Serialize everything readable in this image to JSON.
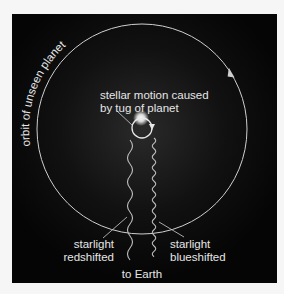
{
  "diagram": {
    "orbit_label": "orbit of unseen planet",
    "stellar_motion_label": {
      "line1": "stellar motion caused",
      "line2": "by tug of planet"
    },
    "redshift_label": {
      "line1": "starlight",
      "line2": "redshifted"
    },
    "blueshift_label": {
      "line1": "starlight",
      "line2": "blueshifted"
    },
    "earth_label": "to Earth",
    "colors": {
      "background": "#050505",
      "frame": "#f6f6f6",
      "lines": "#cfcfcf",
      "text": "#e6e6e6",
      "star_glow": "#ffffff"
    }
  }
}
